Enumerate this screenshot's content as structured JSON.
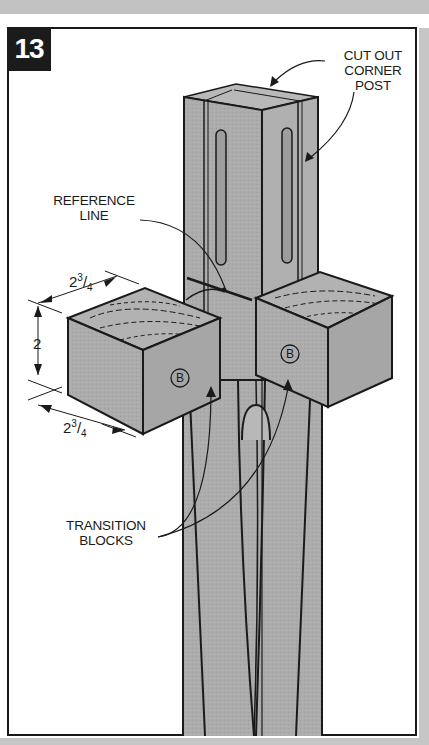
{
  "figure": {
    "number": "13",
    "callouts": {
      "corner_post": [
        "CUT OUT",
        "CORNER",
        "POST"
      ],
      "reference_line": [
        "REFERENCE",
        "LINE"
      ],
      "transition_blocks": [
        "TRANSITION",
        "BLOCKS"
      ]
    },
    "part_labels": {
      "left_block": "B",
      "right_block": "B"
    },
    "dimensions": {
      "top_width": {
        "whole": "2",
        "num": "3",
        "den": "4"
      },
      "height": "2",
      "bottom_depth": {
        "whole": "2",
        "num": "3",
        "den": "4"
      }
    }
  },
  "colors": {
    "wood": "#a9a9a9",
    "wood_light": "#bdbdbd",
    "line": "#1a1a1a",
    "badge": "#1b1b1b",
    "strip": "#c4c4c4"
  }
}
